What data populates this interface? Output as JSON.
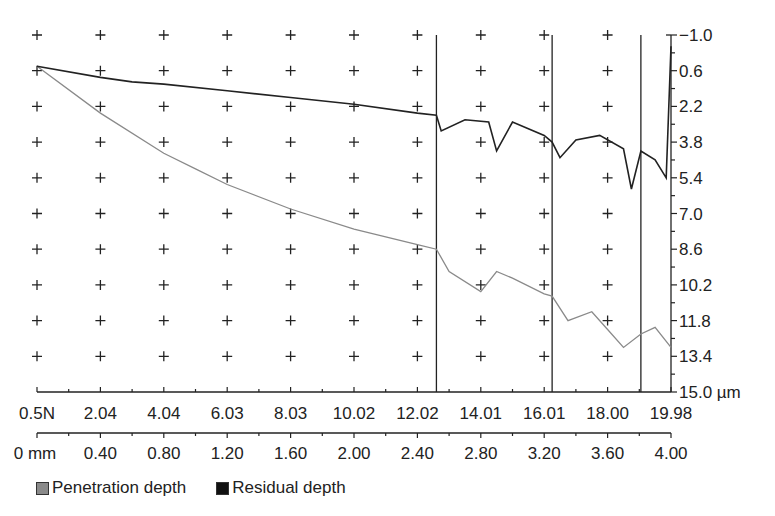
{
  "chart_data": {
    "type": "line",
    "title": "",
    "xlabel_load": "N",
    "xlabel_distance": "mm",
    "ylabel": "µm",
    "x_load_ticks": [
      "0.5N",
      "2.04",
      "4.04",
      "6.03",
      "8.03",
      "10.02",
      "12.02",
      "14.01",
      "16.01",
      "18.00",
      "19.98"
    ],
    "x_distance_ticks": [
      "0 mm",
      "0.40",
      "0.80",
      "1.20",
      "1.60",
      "2.00",
      "2.40",
      "2.80",
      "3.20",
      "3.60",
      "4.00"
    ],
    "y_ticks": [
      "-1.0",
      "0.6",
      "2.2",
      "3.8",
      "5.4",
      "7.0",
      "8.6",
      "10.2",
      "11.8",
      "13.4",
      "15.0 µm"
    ],
    "ylim": [
      -1.0,
      15.0
    ],
    "xlim_distance": [
      0,
      4.0
    ],
    "xlim_load": [
      0.5,
      19.98
    ],
    "vertical_markers_mm": [
      2.52,
      3.25,
      3.81
    ],
    "grid": "cross markers",
    "legend_position": "bottom-left",
    "series": [
      {
        "name": "Penetration depth",
        "color": "#8a8a8a",
        "x_mm": [
          0,
          0.4,
          0.8,
          1.0,
          1.2,
          1.6,
          2.0,
          2.4,
          2.52,
          2.6,
          2.8,
          2.9,
          3.0,
          3.2,
          3.25,
          3.35,
          3.5,
          3.6,
          3.7,
          3.81,
          3.9,
          4.0
        ],
        "y_um": [
          0.4,
          2.5,
          4.3,
          5.0,
          5.7,
          6.8,
          7.7,
          8.4,
          8.6,
          9.6,
          10.5,
          9.6,
          9.9,
          10.6,
          10.7,
          11.8,
          11.4,
          12.2,
          13.0,
          12.4,
          12.1,
          13.0
        ]
      },
      {
        "name": "Residual depth",
        "color": "#222222",
        "x_mm": [
          0,
          0.4,
          0.6,
          0.8,
          1.2,
          1.6,
          2.0,
          2.4,
          2.52,
          2.55,
          2.7,
          2.85,
          2.9,
          3.0,
          3.2,
          3.25,
          3.3,
          3.4,
          3.55,
          3.7,
          3.75,
          3.81,
          3.9,
          3.97,
          4.0
        ],
        "y_um": [
          0.4,
          0.9,
          1.1,
          1.2,
          1.5,
          1.8,
          2.1,
          2.5,
          2.6,
          3.3,
          2.8,
          2.9,
          4.2,
          2.9,
          3.5,
          3.8,
          4.5,
          3.7,
          3.5,
          4.1,
          5.9,
          4.2,
          4.6,
          5.4,
          -0.5
        ]
      }
    ]
  },
  "legend": {
    "items": [
      {
        "label": "Penetration depth",
        "color": "#8a8a8a"
      },
      {
        "label": "Residual depth",
        "color": "#111111"
      }
    ]
  }
}
